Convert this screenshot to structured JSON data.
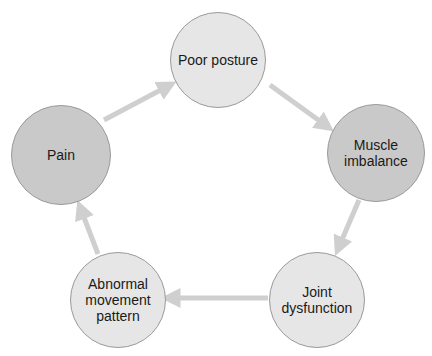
{
  "diagram": {
    "type": "cycle",
    "colors": {
      "light_node": "#e6e6e6",
      "dark_node": "#c9c9c9",
      "node_border": "#9a9a9a",
      "arrow": "#cfcfcf",
      "text": "#1a1a1a"
    },
    "nodes": [
      {
        "id": "poor-posture",
        "label": "Poor posture",
        "cx": 218,
        "cy": 60,
        "r": 48,
        "shade": "light"
      },
      {
        "id": "muscle-imbalance",
        "label": "Muscle\nimbalance",
        "cx": 376,
        "cy": 153,
        "r": 49,
        "shade": "dark"
      },
      {
        "id": "joint-dysfunction",
        "label": "Joint\ndysfunction",
        "cx": 317,
        "cy": 300,
        "r": 48,
        "shade": "light"
      },
      {
        "id": "abnormal-movement-pattern",
        "label": "Abnormal\nmovement\npattern",
        "cx": 118,
        "cy": 300,
        "r": 48,
        "shade": "light"
      },
      {
        "id": "pain",
        "label": "Pain",
        "cx": 61,
        "cy": 155,
        "r": 50,
        "shade": "dark"
      }
    ],
    "edges": [
      {
        "from": "poor-posture",
        "to": "muscle-imbalance",
        "x1": 270,
        "y1": 85,
        "x2": 328,
        "y2": 127
      },
      {
        "from": "muscle-imbalance",
        "to": "joint-dysfunction",
        "x1": 359,
        "y1": 200,
        "x2": 338,
        "y2": 249
      },
      {
        "from": "joint-dysfunction",
        "to": "abnormal-movement-pattern",
        "x1": 268,
        "y1": 298,
        "x2": 168,
        "y2": 298
      },
      {
        "from": "abnormal-movement-pattern",
        "to": "pain",
        "x1": 98,
        "y1": 254,
        "x2": 80,
        "y2": 207
      },
      {
        "from": "pain",
        "to": "poor-posture",
        "x1": 104,
        "y1": 120,
        "x2": 170,
        "y2": 85
      }
    ]
  }
}
